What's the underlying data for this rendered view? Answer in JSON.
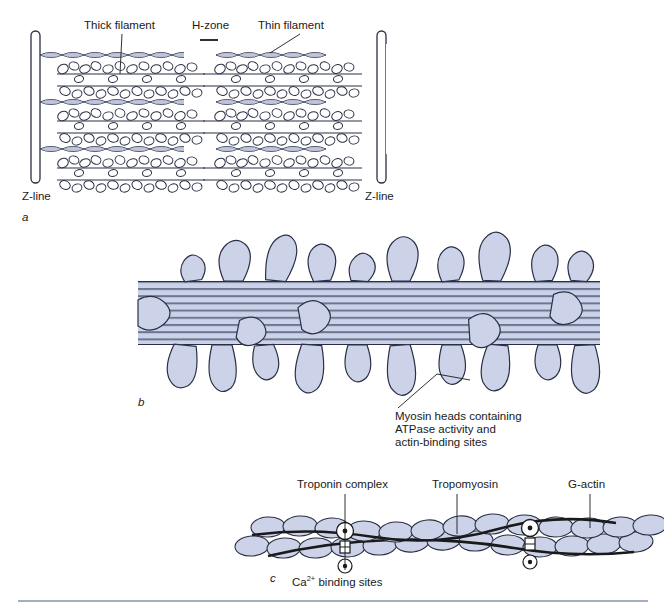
{
  "figure": {
    "background": "#ffffff",
    "rule_color": "#8793ad"
  },
  "colors": {
    "filament_fill": "#ccd3e8",
    "outline": "#2a2f45",
    "stripe": "#6b7694",
    "white": "#ffffff",
    "text": "#1a1a1a",
    "leader": "#1a1a1a"
  },
  "panels": [
    {
      "id": "a",
      "letter": "a",
      "caption": "Sarcomere showing thick and thin filaments between Z-lines",
      "labels": [
        {
          "name": "thick-filament",
          "text": "Thick filament",
          "x": 84,
          "y": 26
        },
        {
          "name": "h-zone",
          "text": "H-zone",
          "x": 192,
          "y": 26
        },
        {
          "name": "thin-filament",
          "text": "Thin filament",
          "x": 258,
          "y": 26
        },
        {
          "name": "z-line-left",
          "text": "Z-line",
          "x": 22,
          "y": 190
        },
        {
          "name": "z-line-right",
          "text": "Z-line",
          "x": 365,
          "y": 190
        }
      ]
    },
    {
      "id": "b",
      "letter": "b",
      "caption": "Thick filament with projecting myosin heads",
      "labels": [
        {
          "name": "myosin-heads-caption-line-1",
          "text": "Myosin heads containing",
          "x": 395,
          "y": 416
        },
        {
          "name": "myosin-heads-caption-line-2",
          "text": "ATPase activity and",
          "x": 395,
          "y": 429
        },
        {
          "name": "myosin-heads-caption-line-3",
          "text": "actin-binding sites",
          "x": 395,
          "y": 442
        }
      ]
    },
    {
      "id": "c",
      "letter": "c",
      "caption": "Thin filament composed of G-actin, tropomyosin and troponin",
      "labels": [
        {
          "name": "troponin-complex",
          "text": "Troponin complex",
          "x": 297,
          "y": 484
        },
        {
          "name": "tropomyosin",
          "text": "Tropomyosin",
          "x": 432,
          "y": 484
        },
        {
          "name": "g-actin",
          "text": "G-actin",
          "x": 568,
          "y": 484
        },
        {
          "name": "ca-binding-sites",
          "text_prefix": "Ca",
          "text_sup": "2+",
          "text_suffix": " binding sites",
          "x": 292,
          "y": 572
        }
      ]
    }
  ]
}
